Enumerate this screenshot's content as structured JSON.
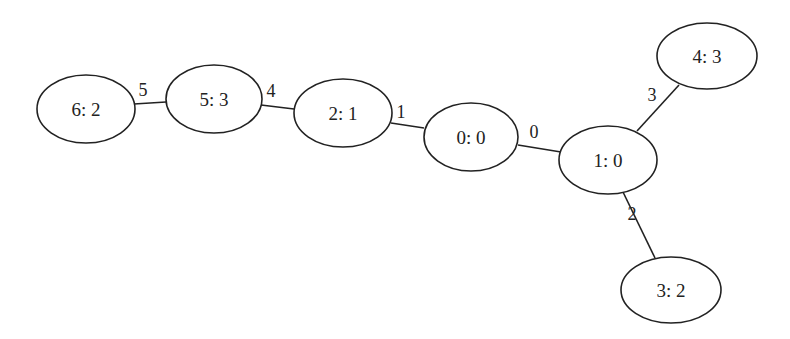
{
  "diagram": {
    "type": "undirected-tree-graph",
    "nodes": [
      {
        "id": "0",
        "label": "0: 0",
        "cx": 471,
        "cy": 137,
        "rx": 47,
        "ry": 34
      },
      {
        "id": "1",
        "label": "1: 0",
        "cx": 608,
        "cy": 160,
        "rx": 49,
        "ry": 34
      },
      {
        "id": "2",
        "label": "2: 1",
        "cx": 343,
        "cy": 113,
        "rx": 49,
        "ry": 34
      },
      {
        "id": "3",
        "label": "3: 2",
        "cx": 671,
        "cy": 290,
        "rx": 50,
        "ry": 33
      },
      {
        "id": "4",
        "label": "4: 3",
        "cx": 707,
        "cy": 56,
        "rx": 50,
        "ry": 33
      },
      {
        "id": "5",
        "label": "5: 3",
        "cx": 214,
        "cy": 99,
        "rx": 48,
        "ry": 34
      },
      {
        "id": "6",
        "label": "6: 2",
        "cx": 86,
        "cy": 109,
        "rx": 49,
        "ry": 34
      }
    ],
    "edges": [
      {
        "label": "0",
        "from": "0",
        "to": "1",
        "x1": 518,
        "y1": 145,
        "x2": 561,
        "y2": 152,
        "lx": 534,
        "ly": 138
      },
      {
        "label": "1",
        "from": "2",
        "to": "0",
        "x1": 391,
        "y1": 123,
        "x2": 424,
        "y2": 128,
        "lx": 401,
        "ly": 118
      },
      {
        "label": "2",
        "from": "1",
        "to": "3",
        "x1": 623,
        "y1": 192,
        "x2": 655,
        "y2": 258,
        "lx": 632,
        "ly": 220
      },
      {
        "label": "3",
        "from": "1",
        "to": "4",
        "x1": 637,
        "y1": 131,
        "x2": 679,
        "y2": 85,
        "lx": 652,
        "ly": 101
      },
      {
        "label": "4",
        "from": "5",
        "to": "2",
        "x1": 261,
        "y1": 105,
        "x2": 294,
        "y2": 109,
        "lx": 271,
        "ly": 97
      },
      {
        "label": "5",
        "from": "6",
        "to": "5",
        "x1": 134,
        "y1": 104,
        "x2": 166,
        "y2": 102,
        "lx": 143,
        "ly": 96
      }
    ]
  }
}
